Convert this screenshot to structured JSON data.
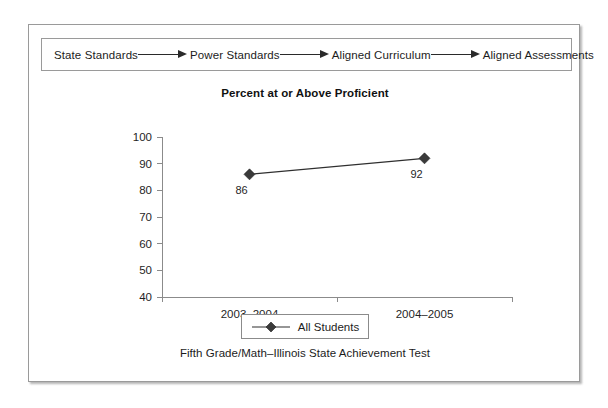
{
  "figure": {
    "flow": {
      "steps": [
        {
          "label": "State Standards"
        },
        {
          "label": "Power Standards"
        },
        {
          "label": "Aligned Curriculum"
        },
        {
          "label": "Aligned Assessments"
        }
      ],
      "arrow_icon": "arrow-right-icon"
    },
    "caption": "Fifth Grade/Math–Illinois State Achievement Test",
    "legend": {
      "marker_icon": "diamond-marker-icon",
      "entries": [
        {
          "label": "All Students"
        }
      ]
    },
    "colors": {
      "frame_border": "#9a9a9a",
      "axis": "#8b8b8b",
      "marker": "#3a3a3a",
      "line": "#2f2f2f",
      "text": "#1c1c1c"
    }
  },
  "chart_data": {
    "type": "line",
    "title": "Percent at or Above Proficient",
    "xlabel": "",
    "ylabel": "",
    "categories": [
      "2003–2004",
      "2004–2005"
    ],
    "series": [
      {
        "name": "All Students",
        "values": [
          86,
          92
        ]
      }
    ],
    "point_labels": [
      "86",
      "92"
    ],
    "ylim": [
      40,
      100
    ],
    "yticks": [
      40,
      50,
      60,
      70,
      80,
      90,
      100
    ],
    "ytick_labels": [
      "40",
      "50",
      "60",
      "70",
      "80",
      "90",
      "100"
    ],
    "grid": false,
    "legend_position": "bottom"
  }
}
